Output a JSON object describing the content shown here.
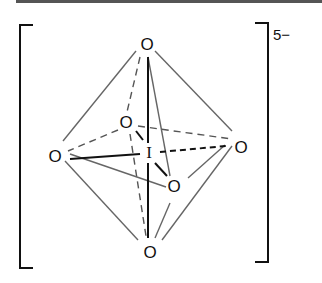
{
  "molecule": {
    "central_atom": "I",
    "ligand_label": "O",
    "charge": "5−",
    "geometry": "octahedral"
  }
}
